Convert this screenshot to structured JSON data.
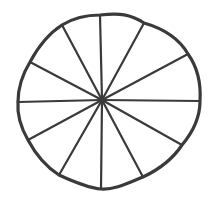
{
  "diagram": {
    "type": "divided-circle",
    "segments": 12,
    "stroke_color": "#3a3a3a",
    "background": "#ffffff",
    "center": [
      102,
      100
    ],
    "ring_path": "M100,15 C120,13 130,14 144,23 C165,29 180,40 188,54 C198,68 201,85 200,101 C200,118 193,132 182,145 C172,160 158,170 143,177 C128,183 115,190 101,189 C88,188 72,181 59,175 C45,166 36,155 28,140 C20,126 17,114 18,102 C18,88 22,75 30,62 C38,47 48,34 62,25 C75,17 88,15 100,15 Z",
    "spokes": [
      {
        "name": "spoke-top",
        "end": [
          100,
          15
        ]
      },
      {
        "name": "spoke-top-right",
        "end": [
          144,
          23
        ]
      },
      {
        "name": "spoke-right-upper",
        "end": [
          188,
          54
        ]
      },
      {
        "name": "spoke-right",
        "end": [
          200,
          101
        ]
      },
      {
        "name": "spoke-right-lower",
        "end": [
          182,
          145
        ]
      },
      {
        "name": "spoke-bottom-right",
        "end": [
          143,
          177
        ]
      },
      {
        "name": "spoke-bottom",
        "end": [
          101,
          189
        ]
      },
      {
        "name": "spoke-bottom-left",
        "end": [
          59,
          175
        ]
      },
      {
        "name": "spoke-left-lower",
        "end": [
          28,
          140
        ]
      },
      {
        "name": "spoke-left",
        "end": [
          18,
          102
        ]
      },
      {
        "name": "spoke-left-upper",
        "end": [
          30,
          62
        ]
      },
      {
        "name": "spoke-top-left",
        "end": [
          62,
          25
        ]
      }
    ]
  }
}
